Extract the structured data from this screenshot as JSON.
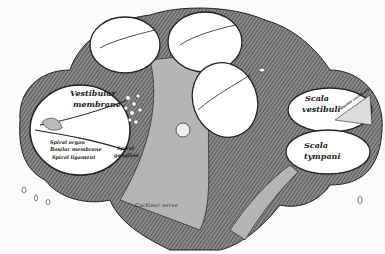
{
  "figure": {
    "style": "engraved anatomical illustration",
    "colors": {
      "ink": "#1a1a1a",
      "tissue_shade": "#6a6a6a",
      "background": "#fbfbfb",
      "lumen": "#ffffff"
    }
  },
  "labels": {
    "vestibular_membrane_1": "Vestibular",
    "vestibular_membrane_2": "membrane",
    "spiral_organ": "Spiral organ",
    "basilar_membrane": "Basilar membrane",
    "spiral_ligament": "Spiral ligament",
    "spiral_ganglion_1": "Spiral",
    "spiral_ganglion_2": "ganglion",
    "scala_vestibuli_1": "Scala",
    "scala_vestibuli_2": "vestibuli",
    "scala_tympani_1": "Scala",
    "scala_tympani_2": "tympani",
    "ductus_cochlearis": "Ductus cochlearis",
    "cochlear_nerve": "Cochlear nerve"
  }
}
